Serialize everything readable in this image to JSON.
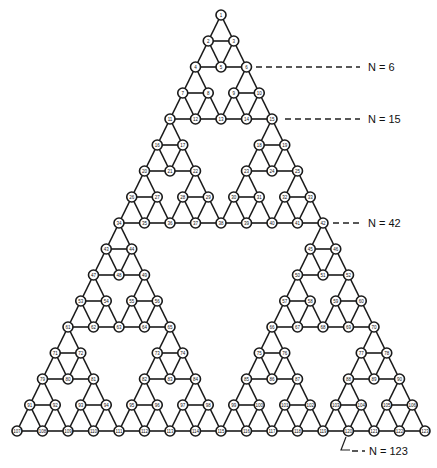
{
  "diagram": {
    "type": "sierpinski-gasket-graph",
    "levels": 4,
    "apex": [
      221,
      15
    ],
    "base_width": 408,
    "height": 416,
    "node_radius": 5,
    "node_count": 123,
    "numbering": "row-by-row top to bottom, left to right, starting at 1"
  },
  "annotations": [
    {
      "label": "N = 6",
      "row": 2,
      "line_x1": 256,
      "line_x2": 360,
      "text_x": 368
    },
    {
      "label": "N = 15",
      "row": 4,
      "line_x1": 285,
      "line_x2": 360,
      "text_x": 368
    },
    {
      "label": "N = 42",
      "row": 8,
      "line_x1": 333,
      "line_x2": 362,
      "text_x": 368
    },
    {
      "label": "N = 123",
      "row": 16,
      "text_x": 369,
      "text_y": 455
    }
  ],
  "colors": {
    "line": "#1a1a1a",
    "background": "#ffffff"
  }
}
